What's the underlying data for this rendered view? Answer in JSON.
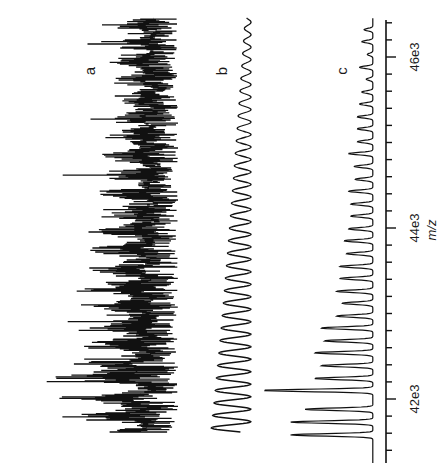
{
  "figure": {
    "orientation": "rotated-90-ccw",
    "panel_labels": [
      "a",
      "b",
      "c"
    ],
    "axis_label": "m/z",
    "tick_labels": [
      "42e3",
      "44e3",
      "46e3"
    ]
  },
  "chart_data": {
    "type": "line",
    "title": "",
    "xlabel": "m/z",
    "ylabel": "",
    "xlim": [
      41250,
      46430
    ],
    "x_major_ticks": [
      42000,
      44000,
      46000
    ],
    "x_major_tick_labels": [
      "42e3",
      "44e3",
      "46e3"
    ],
    "x_minor_tick_step": 200,
    "grid": false,
    "legend": null,
    "annotations": [
      "a",
      "b",
      "c"
    ],
    "series": [
      {
        "name": "a",
        "description": "raw noisy mass spectrum, dense charge-state envelope; max intensity near m/z 42.25e3",
        "baseline_offset": 0,
        "peak_positions_mz": [
          41570,
          41800,
          42000,
          42250,
          42420,
          42640,
          42860,
          43080,
          43300,
          43520,
          43740,
          43960,
          44180,
          44400,
          44620,
          44840,
          45060,
          45280,
          45500,
          45720,
          45940,
          46160,
          46380
        ],
        "peak_intensities": [
          0.95,
          0.93,
          0.88,
          1.0,
          0.86,
          0.82,
          0.78,
          0.74,
          0.72,
          0.68,
          0.66,
          0.63,
          0.58,
          0.55,
          0.52,
          0.5,
          0.48,
          0.46,
          0.44,
          0.42,
          0.42,
          0.4,
          0.38
        ]
      },
      {
        "name": "b",
        "description": "smoothed spectrum, sinusoidal comb with period ~146 m/z, amplitude decaying with m/z",
        "baseline_offset": 1,
        "period_mz": 146,
        "amplitude_start": 0.6,
        "amplitude_end": 0.08,
        "highest_peak_mz": 42100
      },
      {
        "name": "c",
        "description": "deconvolved/filtered spectrum of sharp peaks at ~146 m/z spacing",
        "baseline_offset": 2,
        "peak_positions_mz": [
          41580,
          41730,
          41880,
          42100,
          42240,
          42390,
          42540,
          42680,
          42830,
          42970,
          43120,
          43260,
          43410,
          43550,
          43700,
          43850,
          43990,
          44140,
          44280,
          44430,
          44570,
          44720,
          44870,
          45010,
          45160,
          45300,
          45450,
          45590,
          45740,
          45880,
          46030,
          46180,
          46320
        ],
        "peak_intensities": [
          0.75,
          0.75,
          0.62,
          1.0,
          0.53,
          0.47,
          0.53,
          0.44,
          0.47,
          0.33,
          0.28,
          0.33,
          0.3,
          0.3,
          0.24,
          0.26,
          0.22,
          0.2,
          0.2,
          0.22,
          0.16,
          0.17,
          0.22,
          0.14,
          0.14,
          0.14,
          0.12,
          0.1,
          0.06,
          0.12,
          0.05,
          0.1,
          0.08
        ]
      }
    ]
  }
}
